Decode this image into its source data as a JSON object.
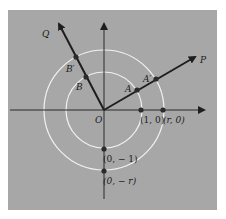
{
  "diagram": {
    "background_color": "#a7a7a7",
    "page_color": "#ffffff",
    "axis_color": "#2a2a2a",
    "circle_color": "#f2f2f2",
    "origin_label": "O",
    "rays": [
      {
        "name": "P",
        "label": "P"
      },
      {
        "name": "Q",
        "label": "Q"
      }
    ],
    "points": {
      "A": "A",
      "A_prime": "A′",
      "B": "B",
      "B_prime": "B′",
      "unit_x": "(1, 0)",
      "r_x": "(r, 0)",
      "unit_neg_y": "(0, − 1)",
      "r_neg_y": "(0, − r)"
    },
    "circles": [
      {
        "name": "unit-circle",
        "radius_label": "1"
      },
      {
        "name": "radius-r-circle",
        "radius_label": "r"
      }
    ]
  }
}
